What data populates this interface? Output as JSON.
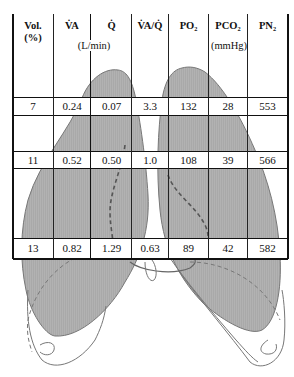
{
  "figure": {
    "fill_color": "#a8a8a8",
    "outline_color": "#777777",
    "dashed_color": "#555555"
  },
  "table": {
    "headers": [
      {
        "key": "vol",
        "label": "Vol.",
        "sub": "(%)"
      },
      {
        "key": "va",
        "label": "V̇A"
      },
      {
        "key": "q",
        "label": "Q̇"
      },
      {
        "key": "vaq",
        "label": "V̇A/Q̇"
      },
      {
        "key": "po2",
        "label": "PO₂"
      },
      {
        "key": "pco2",
        "label": "PCO₂"
      },
      {
        "key": "pn2",
        "label": "PN₂"
      }
    ],
    "units": {
      "flow": "(L/min)",
      "pressure": "(mmHg)"
    },
    "rows": [
      {
        "region": "apex",
        "values": [
          "7",
          "0.24",
          "0.07",
          "3.3",
          "132",
          "28",
          "553"
        ]
      },
      {
        "region": "middle",
        "values": [
          "11",
          "0.52",
          "0.50",
          "1.0",
          "108",
          "39",
          "566"
        ]
      },
      {
        "region": "base",
        "values": [
          "13",
          "0.82",
          "1.29",
          "0.63",
          "89",
          "42",
          "582"
        ]
      }
    ]
  }
}
